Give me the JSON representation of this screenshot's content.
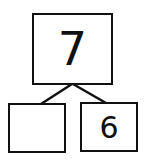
{
  "diagram": {
    "type": "number-bond",
    "whole": "7",
    "parts": [
      "",
      "6"
    ],
    "line_color": "#111111"
  }
}
